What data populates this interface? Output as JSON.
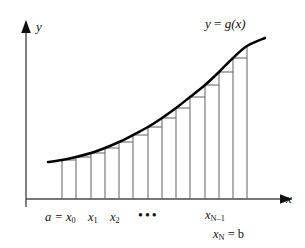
{
  "figure": {
    "background_color": "#ffffff",
    "axis_color": "#4a4a4a",
    "curve_color": "#000000",
    "rect_color": "#6e6e6e",
    "text_color": "#101010"
  },
  "labels": {
    "axis_y": "y",
    "axis_x": "x",
    "curve": "y = g(x)",
    "curve_lhs": "y",
    "curve_eq": "=",
    "curve_rhs": "g(x)",
    "left_first": "a = x",
    "left_first_sub": "0",
    "x1": "x",
    "x1_sub": "1",
    "x2": "x",
    "x2_sub": "2",
    "ellipsis": "•••",
    "xn_minus_1": "x",
    "xn_minus_1_sub": "N–1",
    "xn_eq_b": "x",
    "xn_eq_b_sub": "N",
    "xn_eq_b_tail": " = b"
  },
  "chart_data": {
    "type": "area",
    "xlabel": "x",
    "ylabel": "y",
    "grid": false,
    "legend": null,
    "annotations": [
      "a = x_0",
      "x_1",
      "x_2",
      "⋯",
      "x_{N-1}",
      "x_N = b"
    ],
    "axis_origin_px": [
      26,
      199
    ],
    "x_axis_end_px": [
      292,
      199
    ],
    "y_axis_end_px": [
      26,
      22
    ],
    "curve_points_px": [
      [
        48,
        162
      ],
      [
        62,
        160
      ],
      [
        76,
        157
      ],
      [
        91,
        153
      ],
      [
        105,
        148
      ],
      [
        119,
        142
      ],
      [
        133,
        135
      ],
      [
        148,
        127
      ],
      [
        162,
        118
      ],
      [
        176,
        108
      ],
      [
        190,
        97
      ],
      [
        205,
        85
      ],
      [
        219,
        72
      ],
      [
        233,
        58
      ],
      [
        247,
        46
      ],
      [
        265,
        38
      ]
    ],
    "partition_count": 13,
    "partition_x_px": [
      62,
      76,
      91,
      105,
      119,
      133,
      148,
      162,
      176,
      190,
      205,
      219,
      233,
      247
    ],
    "rectangle_rule": "left-endpoint (inscribed)",
    "rectangle_tops_px": [
      160,
      157,
      153,
      148,
      142,
      135,
      127,
      118,
      108,
      97,
      85,
      72,
      58
    ],
    "baseline_y_px": 199
  }
}
